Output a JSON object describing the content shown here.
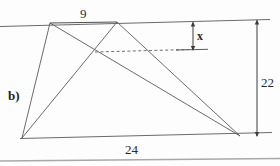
{
  "figure": {
    "name": "quadrilateral-with-inscribed-triangles",
    "part_label": "b)",
    "labels": {
      "top_side": "9",
      "bottom_side": "24",
      "right_height": "22",
      "x_height": "x"
    },
    "colors": {
      "stroke": "#5a5a5a",
      "stroke_dark": "#3c3c3c",
      "dashed": "#6e6e6e",
      "text": "#2b2b2b",
      "background": "#fdfdfd",
      "page_rule": "#a8a8a8"
    },
    "geometry": {
      "top_left_vertex": [
        50,
        23
      ],
      "apex_vertex": [
        117,
        22
      ],
      "bottom_left_vertex": [
        22,
        138
      ],
      "bottom_right_vertex": [
        240,
        136
      ],
      "intersection_point": [
        95,
        52
      ],
      "top_line": [
        [
          0,
          26
        ],
        [
          270,
          19
        ]
      ],
      "bottom_line": [
        [
          22,
          138
        ],
        [
          272,
          132
        ]
      ],
      "dashed_line": [
        [
          95,
          52
        ],
        [
          190,
          49
        ]
      ],
      "dashed_tail_solid": [
        [
          190,
          49
        ],
        [
          207,
          49
        ]
      ],
      "dim_x_arrow": [
        [
          193,
          22
        ],
        [
          193,
          50
        ]
      ],
      "dim_height_arrow": [
        [
          257,
          21
        ],
        [
          257,
          136
        ]
      ],
      "page_rule_line": [
        [
          0,
          161
        ],
        [
          280,
          158
        ]
      ]
    }
  }
}
